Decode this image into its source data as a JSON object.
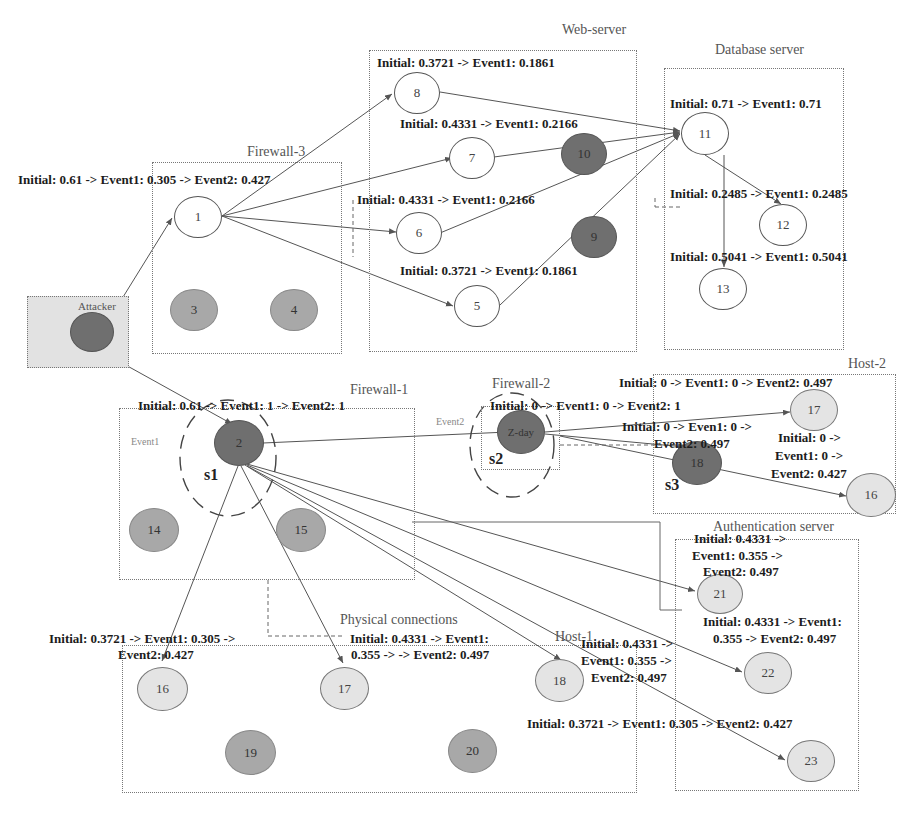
{
  "zones": {
    "firewall3": "Firewall-3",
    "web_server": "Web-server",
    "database_server": "Database server",
    "attacker": "Attacker",
    "firewall1": "Firewall-1",
    "firewall2": "Firewall-2",
    "host2": "Host-2",
    "authentication_server": "Authentication server",
    "physical_connections": "Physical connections",
    "host1": "Host-1"
  },
  "nodes": {
    "n1": "1",
    "n2": "2",
    "n3": "3",
    "n4": "4",
    "n5": "5",
    "n6": "6",
    "n7": "7",
    "n8": "8",
    "n9": "9",
    "n10": "10",
    "n11": "11",
    "n12": "12",
    "n13": "13",
    "n14": "14",
    "n15": "15",
    "n16_h1": "16",
    "n17_h1": "17",
    "n18_h1": "18",
    "n19": "19",
    "n20": "20",
    "n21": "21",
    "n22": "22",
    "n23": "23",
    "zday": "Z-day",
    "n18_h2": "18",
    "n17_h2": "17",
    "n16_h2": "16"
  },
  "states": {
    "s1": "s1",
    "s2": "s2",
    "s3": "s3"
  },
  "event_markers": {
    "event1": "Event1",
    "event2": "Event2"
  },
  "labels": {
    "node1": "Initial: 0.61 -> Event1: 0.305 -> Event2: 0.427",
    "node8": "Initial: 0.3721 -> Event1: 0.1861",
    "node7": "Initial: 0.4331 -> Event1: 0.2166",
    "node6": "Initial: 0.4331 -> Event1: 0.2166",
    "node5": "Initial: 0.3721 -> Event1: 0.1861",
    "node11": "Initial: 0.71 -> Event1: 0.71",
    "node12": "Initial: 0.2485 -> Event1: 0.2485",
    "node13": "Initial: 0.5041 -> Event1: 0.5041",
    "node2": "Initial: 0.61 -> Event1: 1 -> Event2: 1",
    "zday": "Initial: 0 -> Event1: 0 -> Event2: 1",
    "host2_17": "Initial: 0 -> Event1: 0 -> Event2: 0.497",
    "host2_18_l1": "Initial: 0 -> Even1: 0 ->",
    "host2_18_l2": "Event2: 0.497",
    "host2_16_l1": "Initial: 0 ->",
    "host2_16_l2": "Event1: 0 ->",
    "host2_16_l3": "Event2: 0.427",
    "node21_l1": "Initial: 0.4331 ->",
    "node21_l2": "Event1: 0.355  ->",
    "node21_l3": "Event2: 0.497",
    "node22_l1": "Initial: 0.4331 -> Event1:",
    "node22_l2": "0.355 -> Event2: 0.497",
    "node23": "Initial: 0.3721 -> Event1: 0.305 -> Event2: 0.427",
    "host1_16_l1": "Initial: 0.3721 -> Event1: 0.305 ->",
    "host1_16_l2": "Event2: 0.427",
    "host1_17_l1": "Initial: 0.4331 -> Event1:",
    "host1_17_l2": "0.355 -> -> Event2: 0.497",
    "host1_18_l1": "Initial: 0.4331 ->",
    "host1_18_l2": "Event1: 0.355 ->",
    "host1_18_l3": "Event2: 0.497"
  },
  "colors": {
    "edge": "#555555",
    "node_dark": "#6f6f6f",
    "node_mid": "#a8a8a8",
    "node_light": "#e4e4e4",
    "attacker_bg": "#e2e2e2"
  }
}
